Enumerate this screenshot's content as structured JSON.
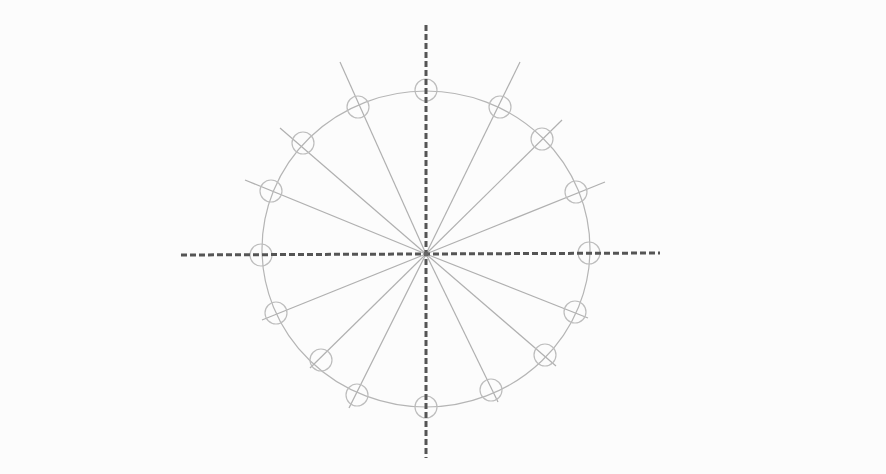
{
  "diagram": {
    "type": "radial-spoke-circle",
    "background": "#fcfcfc",
    "center": {
      "x": 426,
      "y": 254
    },
    "main_circle": {
      "rx": 164,
      "ry": 158,
      "stroke": "#b5b5b5",
      "stroke_width": 1.2
    },
    "axes": {
      "color": "#555555",
      "stroke_width": 3,
      "dash": "6 3",
      "horizontal": {
        "x1": 181,
        "y1": 255,
        "x2": 660,
        "y2": 253
      },
      "vertical": {
        "x1": 426,
        "y1": 25,
        "x2": 426,
        "y2": 458
      }
    },
    "spoke_style": {
      "stroke": "#b0b0b0",
      "stroke_width": 1.2
    },
    "marker_style": {
      "r": 11,
      "stroke": "#bdbdbd",
      "stroke_width": 1.2,
      "fill": "none"
    },
    "spokes": [
      {
        "x2": 340,
        "y2": 62
      },
      {
        "x2": 280,
        "y2": 128
      },
      {
        "x2": 245,
        "y2": 180
      },
      {
        "x2": 520,
        "y2": 62
      },
      {
        "x2": 562,
        "y2": 120
      },
      {
        "x2": 605,
        "y2": 182
      },
      {
        "x2": 262,
        "y2": 320
      },
      {
        "x2": 310,
        "y2": 368
      },
      {
        "x2": 349,
        "y2": 408
      },
      {
        "x2": 588,
        "y2": 318
      },
      {
        "x2": 556,
        "y2": 366
      },
      {
        "x2": 498,
        "y2": 402
      }
    ],
    "markers": [
      {
        "cx": 426,
        "cy": 90
      },
      {
        "cx": 500,
        "cy": 107
      },
      {
        "cx": 542,
        "cy": 139
      },
      {
        "cx": 576,
        "cy": 192
      },
      {
        "cx": 589,
        "cy": 253
      },
      {
        "cx": 575,
        "cy": 312
      },
      {
        "cx": 545,
        "cy": 355
      },
      {
        "cx": 491,
        "cy": 390
      },
      {
        "cx": 426,
        "cy": 407
      },
      {
        "cx": 357,
        "cy": 395
      },
      {
        "cx": 321,
        "cy": 360
      },
      {
        "cx": 276,
        "cy": 313
      },
      {
        "cx": 261,
        "cy": 255
      },
      {
        "cx": 271,
        "cy": 191
      },
      {
        "cx": 303,
        "cy": 143
      },
      {
        "cx": 358,
        "cy": 107
      }
    ]
  }
}
